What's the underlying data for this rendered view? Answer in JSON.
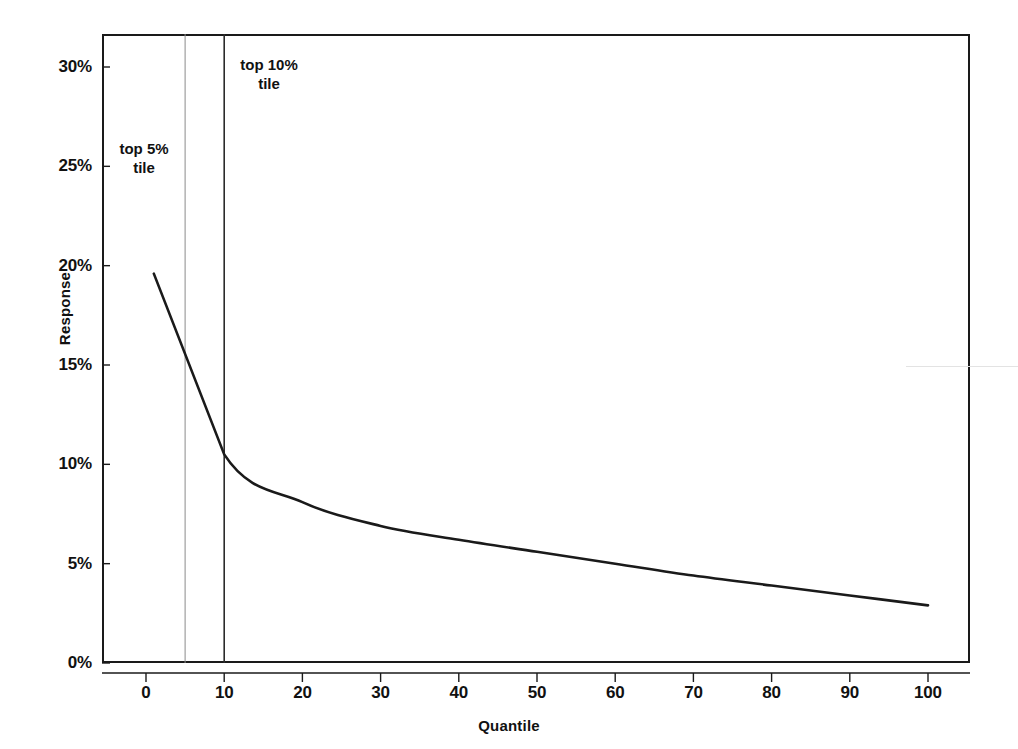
{
  "chart_data": {
    "type": "line",
    "title": "",
    "xlabel": "Quantile",
    "ylabel": "Response",
    "xlim": [
      -4,
      110
    ],
    "ylim": [
      0,
      31.7
    ],
    "grid": false,
    "legend": null,
    "x": [
      1,
      10,
      20,
      30,
      40,
      50,
      60,
      70,
      80,
      90,
      100
    ],
    "values": [
      19.6,
      10.5,
      8.1,
      6.9,
      6.2,
      5.6,
      5.0,
      4.4,
      3.9,
      3.4,
      2.9
    ],
    "series": [
      {
        "name": "Response",
        "x": [
          1,
          10,
          20,
          30,
          40,
          50,
          60,
          70,
          80,
          90,
          100
        ],
        "values": [
          19.6,
          10.5,
          8.1,
          6.9,
          6.2,
          5.6,
          5.0,
          4.4,
          3.9,
          3.4,
          2.9
        ],
        "color": "#1a1a1a"
      }
    ],
    "y_ticks": [
      0,
      5,
      10,
      15,
      20,
      25,
      30
    ],
    "y_tick_labels": [
      "0%",
      "5%",
      "10%",
      "15%",
      "20%",
      "25%",
      "30%"
    ],
    "x_ticks": [
      0,
      10,
      20,
      30,
      40,
      50,
      60,
      70,
      80,
      90,
      100
    ],
    "x_tick_labels": [
      "0",
      "10",
      "20",
      "30",
      "40",
      "50",
      "60",
      "70",
      "80",
      "90",
      "100"
    ],
    "annotations": [
      {
        "id": "top5",
        "text": "top 5%\ntile",
        "x_value": 5,
        "line_color": "#8a8a8a"
      },
      {
        "id": "top10",
        "text": "top 10%\ntile",
        "x_value": 10,
        "line_color": "#2b2b2b"
      }
    ]
  },
  "axes": {
    "y_title": "Response",
    "x_title": "Quantile"
  },
  "annotations": {
    "top5_label": "top 5%\ntile",
    "top10_label": "top 10%\ntile"
  },
  "colors": {
    "curve": "#1a1a1a",
    "frame": "#1a1a1a",
    "text": "#111111",
    "ref_line_light": "#8a8a8a",
    "ref_line_dark": "#2b2b2b",
    "background": "#ffffff"
  }
}
